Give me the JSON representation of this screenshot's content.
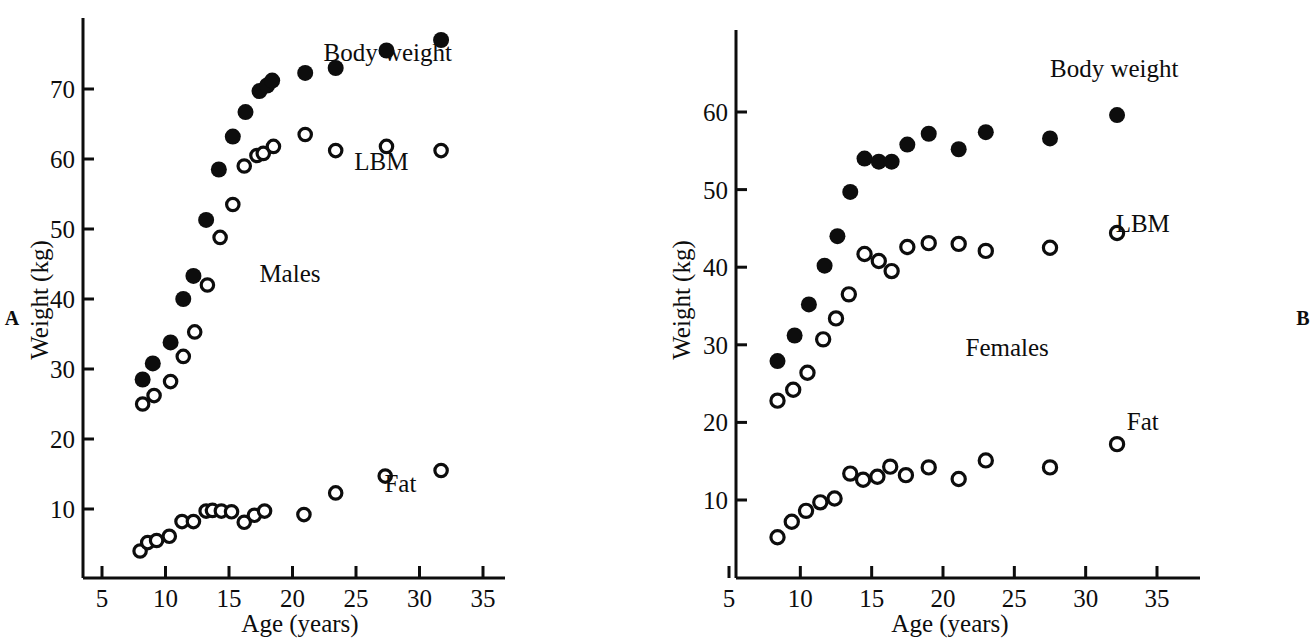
{
  "figure": {
    "panel_a_letter": "A",
    "panel_b_letter": "B",
    "marker_legend": {
      "filled_circle": "body weight (closed circles)",
      "open_circle": "LBM and Fat (open circles)"
    }
  },
  "chart_data": [
    {
      "type": "scatter",
      "panel": "A",
      "title": "Males",
      "xlabel": "Age (years)",
      "ylabel": "Weight (kg)",
      "xlim": [
        5,
        36
      ],
      "ylim": [
        2,
        79
      ],
      "xticks": [
        5,
        10,
        15,
        20,
        25,
        30,
        35
      ],
      "xticklabels": [
        "5",
        "10",
        "15",
        "20",
        "25",
        "30",
        "35"
      ],
      "yticks": [
        10,
        20,
        30,
        40,
        50,
        60,
        70
      ],
      "yticklabels": [
        "10",
        "20",
        "30",
        "40",
        "50",
        "60",
        "70"
      ],
      "grid": false,
      "legend_position": "inline-right",
      "annotations": [
        {
          "text": "Body weight",
          "x": 27.5,
          "y": 74.0
        },
        {
          "text": "LBM",
          "x": 27.0,
          "y": 58.5
        },
        {
          "text": "Males",
          "x": 19.8,
          "y": 42.5
        },
        {
          "text": "Fat",
          "x": 28.5,
          "y": 12.5
        }
      ],
      "series": [
        {
          "name": "Body weight",
          "marker": "filled-circle",
          "points": [
            [
              8.2,
              28.5
            ],
            [
              9.0,
              30.8
            ],
            [
              10.4,
              33.8
            ],
            [
              11.4,
              40.0
            ],
            [
              12.2,
              43.3
            ],
            [
              13.2,
              51.3
            ],
            [
              14.2,
              58.5
            ],
            [
              15.3,
              63.2
            ],
            [
              16.3,
              66.7
            ],
            [
              17.4,
              69.7
            ],
            [
              18.0,
              70.5
            ],
            [
              18.4,
              71.2
            ],
            [
              21.0,
              72.3
            ],
            [
              23.4,
              73.0
            ],
            [
              27.4,
              75.5
            ],
            [
              31.7,
              77.0
            ]
          ]
        },
        {
          "name": "LBM",
          "marker": "open-circle",
          "points": [
            [
              8.2,
              25.0
            ],
            [
              9.1,
              26.2
            ],
            [
              10.4,
              28.2
            ],
            [
              11.4,
              31.8
            ],
            [
              12.3,
              35.3
            ],
            [
              13.3,
              42.0
            ],
            [
              14.3,
              48.8
            ],
            [
              15.3,
              53.5
            ],
            [
              16.2,
              59.0
            ],
            [
              17.2,
              60.5
            ],
            [
              17.7,
              60.8
            ],
            [
              18.5,
              61.8
            ],
            [
              21.0,
              63.5
            ],
            [
              23.4,
              61.2
            ],
            [
              27.4,
              61.8
            ],
            [
              31.7,
              61.2
            ]
          ]
        },
        {
          "name": "Fat",
          "marker": "open-circle",
          "points": [
            [
              8.0,
              4.0
            ],
            [
              8.6,
              5.2
            ],
            [
              9.3,
              5.5
            ],
            [
              10.3,
              6.1
            ],
            [
              11.3,
              8.2
            ],
            [
              12.2,
              8.2
            ],
            [
              13.2,
              9.7
            ],
            [
              13.7,
              9.8
            ],
            [
              14.4,
              9.7
            ],
            [
              15.2,
              9.6
            ],
            [
              16.2,
              8.1
            ],
            [
              17.0,
              9.1
            ],
            [
              17.8,
              9.7
            ],
            [
              20.9,
              9.2
            ],
            [
              23.4,
              12.3
            ],
            [
              27.3,
              14.7
            ],
            [
              31.7,
              15.5
            ]
          ]
        }
      ]
    },
    {
      "type": "scatter",
      "panel": "B",
      "title": "Females",
      "xlabel": "Age (years)",
      "ylabel": "Weight (kg)",
      "xlim": [
        5,
        36
      ],
      "ylim": [
        2,
        68
      ],
      "xticks": [
        5,
        10,
        15,
        20,
        25,
        30,
        35
      ],
      "xticklabels": [
        "5",
        "10",
        "15",
        "20",
        "25",
        "30",
        "35"
      ],
      "yticks": [
        10,
        20,
        30,
        40,
        50,
        60
      ],
      "yticklabels": [
        "10",
        "20",
        "30",
        "40",
        "50",
        "60"
      ],
      "grid": false,
      "legend_position": "inline-right",
      "annotations": [
        {
          "text": "Body weight",
          "x": 32.0,
          "y": 64.5
        },
        {
          "text": "LBM",
          "x": 34.0,
          "y": 44.5
        },
        {
          "text": "Fat",
          "x": 34.0,
          "y": 19.0
        },
        {
          "text": "Females",
          "x": 24.5,
          "y": 28.5
        }
      ],
      "series": [
        {
          "name": "Body weight",
          "marker": "filled-circle",
          "points": [
            [
              8.4,
              27.9
            ],
            [
              9.6,
              31.2
            ],
            [
              10.6,
              35.2
            ],
            [
              11.7,
              40.2
            ],
            [
              12.6,
              44.0
            ],
            [
              13.5,
              49.7
            ],
            [
              14.5,
              54.0
            ],
            [
              15.5,
              53.6
            ],
            [
              16.4,
              53.6
            ],
            [
              17.5,
              55.8
            ],
            [
              19.0,
              57.2
            ],
            [
              21.1,
              55.2
            ],
            [
              23.0,
              57.4
            ],
            [
              27.5,
              56.6
            ],
            [
              32.2,
              59.6
            ]
          ]
        },
        {
          "name": "LBM",
          "marker": "open-circle",
          "points": [
            [
              8.4,
              22.8
            ],
            [
              9.5,
              24.2
            ],
            [
              10.5,
              26.4
            ],
            [
              11.6,
              30.7
            ],
            [
              12.5,
              33.4
            ],
            [
              13.4,
              36.5
            ],
            [
              14.5,
              41.7
            ],
            [
              15.5,
              40.8
            ],
            [
              16.4,
              39.5
            ],
            [
              17.5,
              42.6
            ],
            [
              19.0,
              43.1
            ],
            [
              21.1,
              43.0
            ],
            [
              23.0,
              42.1
            ],
            [
              27.5,
              42.5
            ],
            [
              32.2,
              44.4
            ]
          ]
        },
        {
          "name": "Fat",
          "marker": "open-circle",
          "points": [
            [
              8.4,
              5.2
            ],
            [
              9.4,
              7.2
            ],
            [
              10.4,
              8.6
            ],
            [
              11.4,
              9.7
            ],
            [
              12.4,
              10.2
            ],
            [
              13.5,
              13.4
            ],
            [
              14.4,
              12.6
            ],
            [
              15.4,
              13.0
            ],
            [
              16.3,
              14.3
            ],
            [
              17.4,
              13.2
            ],
            [
              19.0,
              14.2
            ],
            [
              21.1,
              12.7
            ],
            [
              23.0,
              15.1
            ],
            [
              27.5,
              14.2
            ],
            [
              32.2,
              17.2
            ]
          ]
        }
      ]
    }
  ]
}
